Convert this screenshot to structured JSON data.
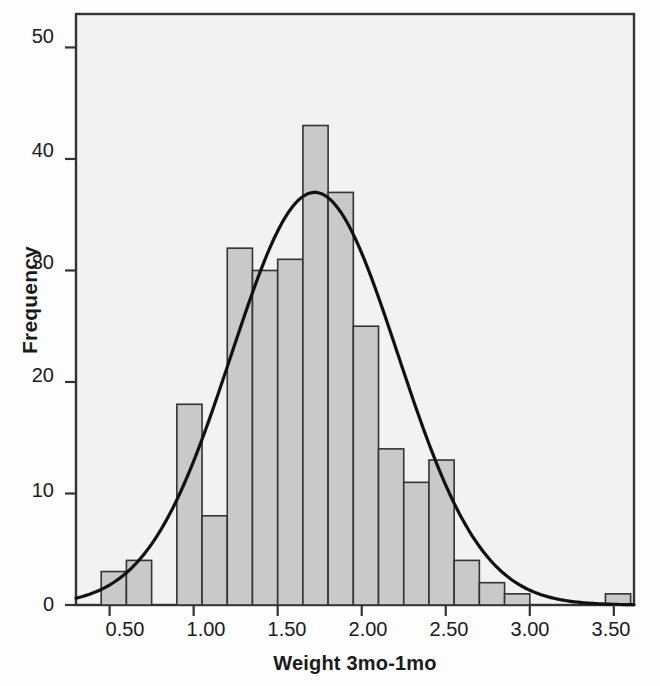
{
  "chart_data": {
    "type": "bar",
    "title": "",
    "subtitle": "",
    "xlabel": "Weight 3mo-1mo",
    "ylabel": "Frequency",
    "xlim": [
      0.3,
      3.62
    ],
    "ylim": [
      0,
      53
    ],
    "grid": false,
    "legend_position": "none",
    "bin_width": 0.15,
    "bin_edges": [
      0.45,
      0.6,
      0.75,
      0.9,
      1.05,
      1.2,
      1.35,
      1.5,
      1.65,
      1.8,
      1.95,
      2.1,
      2.25,
      2.4,
      2.55,
      2.7,
      2.85,
      3.0,
      3.15,
      3.3,
      3.45,
      3.6
    ],
    "categories": [
      "0.45-0.60",
      "0.60-0.75",
      "0.75-0.90",
      "0.90-1.05",
      "1.05-1.20",
      "1.20-1.35",
      "1.35-1.50",
      "1.50-1.65",
      "1.65-1.80",
      "1.80-1.95",
      "1.95-2.10",
      "2.10-2.25",
      "2.25-2.40",
      "2.40-2.55",
      "2.55-2.70",
      "2.70-2.85",
      "2.85-3.00",
      "3.00-3.15",
      "3.15-3.30",
      "3.30-3.45",
      "3.45-3.60"
    ],
    "values": [
      3,
      4,
      0,
      18,
      8,
      32,
      30,
      31,
      43,
      37,
      25,
      14,
      11,
      13,
      4,
      2,
      1,
      0,
      0,
      0,
      1
    ],
    "x_ticks": [
      0.5,
      1.0,
      1.5,
      2.0,
      2.5,
      3.0,
      3.5
    ],
    "x_tick_labels": [
      "0.50",
      "1.00",
      "1.50",
      "2.00",
      "2.50",
      "3.00",
      "3.50"
    ],
    "y_ticks": [
      0,
      10,
      20,
      30,
      40,
      50
    ],
    "y_tick_labels": [
      "0",
      "10",
      "20",
      "30",
      "40",
      "50"
    ],
    "overlay_curve": {
      "name": "Normal curve",
      "mean": 1.72,
      "std_dev": 0.496,
      "n": 277,
      "peak_frequency": 37
    },
    "colors": {
      "bar_fill": "#c9c9c9",
      "bar_edge": "#333333",
      "curve": "#111111",
      "plot_background": "#f2f2f2",
      "axis": "#333333",
      "text": "#1a1a1a"
    }
  },
  "annotation": {
    "mean_label": "Mean = 1.72",
    "std_label": "Std. Dev. = 0.496",
    "n_italic": "N",
    "n_value": " = 277"
  }
}
